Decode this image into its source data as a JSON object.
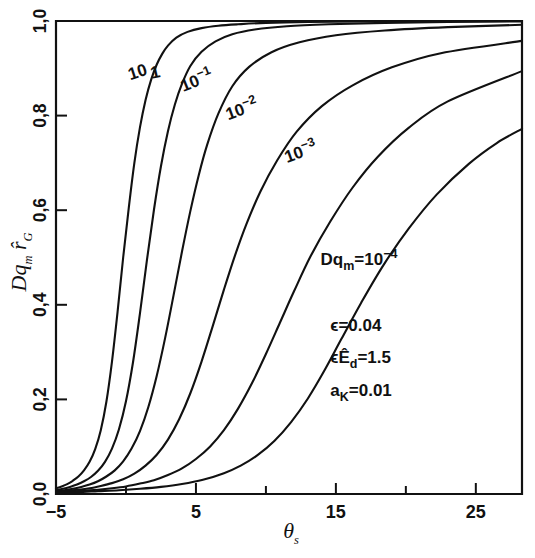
{
  "figure": {
    "background": "#ffffff",
    "ink_color": "#111111"
  },
  "chart_data": {
    "type": "line",
    "title": "",
    "subtitle": "",
    "xlabel": "θs",
    "ylabel": "Dqm r̂G",
    "xlim": [
      -5,
      28.3
    ],
    "ylim": [
      0.0,
      1.0
    ],
    "grid": false,
    "legend_position": "inline-curve-labels",
    "x_major_ticks": [
      -5,
      5,
      15,
      25
    ],
    "x_major_tick_labels": [
      "−5",
      "5",
      "15",
      "25"
    ],
    "x_minor_ticks": [
      0,
      10,
      20
    ],
    "y_major_ticks": [
      0.0,
      0.2,
      0.4,
      0.6,
      0.8,
      1.0
    ],
    "y_major_tick_labels": [
      "0,0",
      "0,2",
      "0,4",
      "0,6",
      "0,8",
      "1,0"
    ],
    "series": [
      {
        "name": "10",
        "label": "10",
        "label_x": 0.3,
        "label_y": 0.875,
        "x": [
          -5.0,
          -4.6,
          -4.2,
          -3.8,
          -3.4,
          -3.0,
          -2.6,
          -2.2,
          -1.8,
          -1.4,
          -1.0,
          -0.6,
          -0.2,
          0.2,
          0.6,
          1.0,
          1.4,
          1.8,
          2.2,
          2.6,
          3.0,
          3.6,
          4.4,
          5.4,
          6.6,
          8.0,
          10.0,
          13.0,
          17.0,
          22.0,
          28.3
        ],
        "y": [
          0.012,
          0.016,
          0.021,
          0.028,
          0.037,
          0.05,
          0.068,
          0.095,
          0.135,
          0.195,
          0.28,
          0.385,
          0.5,
          0.605,
          0.7,
          0.775,
          0.833,
          0.876,
          0.908,
          0.931,
          0.948,
          0.965,
          0.977,
          0.985,
          0.99,
          0.993,
          0.996,
          0.998,
          0.999,
          0.9995,
          1.0
        ]
      },
      {
        "name": "1",
        "label": "1",
        "label_x": 1.85,
        "label_y": 0.878,
        "x": [
          -5.0,
          -4.5,
          -4.0,
          -3.5,
          -3.0,
          -2.5,
          -2.0,
          -1.5,
          -1.0,
          -0.5,
          0.0,
          0.5,
          1.0,
          1.5,
          2.0,
          2.5,
          3.0,
          3.5,
          4.0,
          4.6,
          5.4,
          6.4,
          7.6,
          9.2,
          11.5,
          14.5,
          18.5,
          23.0,
          28.3
        ],
        "y": [
          0.008,
          0.011,
          0.015,
          0.02,
          0.027,
          0.036,
          0.049,
          0.068,
          0.096,
          0.137,
          0.196,
          0.278,
          0.382,
          0.495,
          0.601,
          0.693,
          0.767,
          0.824,
          0.867,
          0.905,
          0.935,
          0.957,
          0.972,
          0.982,
          0.989,
          0.993,
          0.996,
          0.998,
          0.999
        ]
      },
      {
        "name": "10^-1",
        "label": "10",
        "label_exp": "−1",
        "label_x": 4.1,
        "label_y": 0.85,
        "x": [
          -5.0,
          -4.4,
          -3.8,
          -3.2,
          -2.6,
          -2.0,
          -1.4,
          -0.8,
          -0.2,
          0.4,
          1.0,
          1.6,
          2.2,
          2.8,
          3.4,
          4.0,
          4.6,
          5.2,
          5.8,
          6.6,
          7.6,
          8.8,
          10.4,
          12.4,
          15.0,
          18.5,
          23.0,
          28.3
        ],
        "y": [
          0.006,
          0.008,
          0.011,
          0.015,
          0.02,
          0.027,
          0.037,
          0.05,
          0.069,
          0.096,
          0.133,
          0.184,
          0.25,
          0.33,
          0.42,
          0.512,
          0.598,
          0.674,
          0.738,
          0.804,
          0.862,
          0.903,
          0.934,
          0.955,
          0.97,
          0.98,
          0.987,
          0.992
        ]
      },
      {
        "name": "10^-2",
        "label": "10",
        "label_exp": "−2",
        "label_x": 7.3,
        "label_y": 0.79,
        "x": [
          -5.0,
          -4.2,
          -3.4,
          -2.6,
          -1.8,
          -1.0,
          -0.2,
          0.6,
          1.4,
          2.2,
          3.0,
          3.8,
          4.6,
          5.4,
          6.2,
          7.0,
          7.8,
          8.6,
          9.6,
          10.8,
          12.2,
          14.0,
          16.2,
          19.0,
          22.5,
          28.3
        ],
        "y": [
          0.005,
          0.007,
          0.009,
          0.012,
          0.017,
          0.023,
          0.031,
          0.043,
          0.06,
          0.083,
          0.115,
          0.158,
          0.213,
          0.28,
          0.355,
          0.432,
          0.505,
          0.57,
          0.639,
          0.705,
          0.766,
          0.82,
          0.864,
          0.902,
          0.932,
          0.958
        ]
      },
      {
        "name": "10^-3",
        "label": "10",
        "label_exp": "−3",
        "label_x": 11.5,
        "label_y": 0.7,
        "x": [
          -5.0,
          -4.0,
          -3.0,
          -2.0,
          -1.0,
          0.0,
          1.0,
          2.0,
          3.0,
          4.0,
          5.0,
          6.0,
          7.0,
          8.0,
          9.0,
          10.0,
          11.0,
          12.0,
          13.2,
          14.6,
          16.2,
          18.0,
          20.2,
          23.0,
          28.3
        ],
        "y": [
          0.004,
          0.005,
          0.007,
          0.009,
          0.012,
          0.016,
          0.022,
          0.029,
          0.04,
          0.054,
          0.074,
          0.1,
          0.135,
          0.18,
          0.234,
          0.296,
          0.362,
          0.428,
          0.503,
          0.576,
          0.648,
          0.713,
          0.774,
          0.83,
          0.894
        ]
      },
      {
        "name": "10^-4",
        "label": "Dqm=10−4",
        "label_x": 13.9,
        "label_y": 0.485,
        "x": [
          -5.0,
          -3.5,
          -2.0,
          -0.5,
          1.0,
          2.5,
          4.0,
          5.5,
          7.0,
          8.2,
          9.4,
          10.6,
          11.8,
          13.0,
          14.2,
          15.4,
          16.8,
          18.4,
          20.2,
          22.2,
          24.5,
          26.5,
          28.3
        ],
        "y": [
          0.003,
          0.004,
          0.006,
          0.008,
          0.011,
          0.015,
          0.021,
          0.03,
          0.044,
          0.06,
          0.082,
          0.112,
          0.152,
          0.202,
          0.262,
          0.328,
          0.404,
          0.484,
          0.561,
          0.633,
          0.698,
          0.742,
          0.772
        ]
      }
    ],
    "annotations": [
      {
        "name": "curve-label-dqm",
        "text": "Dq",
        "sub": "m",
        "eq": "=10",
        "sup": "−4",
        "x": 13.9,
        "y": 0.485
      },
      {
        "name": "param-epsilon",
        "text": "ϵ=0.04",
        "x": 14.6,
        "y": 0.345
      },
      {
        "name": "param-epsilon-ed",
        "text": "ϵÊ",
        "sub": "d",
        "eq": "=1.5",
        "x": 14.6,
        "y": 0.277
      },
      {
        "name": "param-alpha-k",
        "text": "a",
        "sub": "K",
        "eq": "=0.01",
        "x": 14.6,
        "y": 0.207
      }
    ]
  },
  "labels": {
    "x_axis_title": "θ",
    "x_axis_title_sub": "s",
    "y_axis_title_main": "Dq",
    "y_axis_title_sub": "m",
    "y_axis_title_second": "r̂",
    "y_axis_title_second_sub": "G"
  }
}
